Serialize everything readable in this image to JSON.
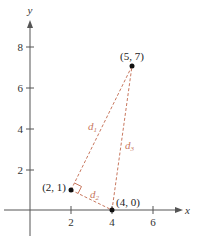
{
  "diagram": {
    "axes": {
      "x_label": "x",
      "y_label": "y",
      "x_ticks": [
        {
          "value": 2,
          "label": "2"
        },
        {
          "value": 4,
          "label": "4"
        },
        {
          "value": 6,
          "label": "6"
        }
      ],
      "y_ticks": [
        {
          "value": 2,
          "label": "2"
        },
        {
          "value": 4,
          "label": "4"
        },
        {
          "value": 6,
          "label": "6"
        },
        {
          "value": 8,
          "label": "8"
        }
      ]
    },
    "points": [
      {
        "label": "(2, 1)",
        "x": 2,
        "y": 1
      },
      {
        "label": "(4, 0)",
        "x": 4,
        "y": 0
      },
      {
        "label": "(5, 7)",
        "x": 5,
        "y": 7
      }
    ],
    "segments": [
      {
        "name": "d",
        "sub": "1",
        "from": "(2, 1)",
        "to": "(5, 7)"
      },
      {
        "name": "d",
        "sub": "2",
        "from": "(2, 1)",
        "to": "(4, 0)"
      },
      {
        "name": "d",
        "sub": "3",
        "from": "(4, 0)",
        "to": "(5, 7)"
      }
    ],
    "right_angle_at": "(2, 1)",
    "colors": {
      "axis": "#555555",
      "segment": "#c8785f",
      "point": "#111111"
    }
  }
}
